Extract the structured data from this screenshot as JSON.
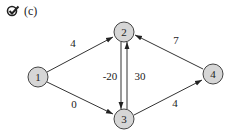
{
  "caption": {
    "icon": "check-badge-icon",
    "label": "(c)"
  },
  "graph": {
    "nodes": [
      {
        "id": "1",
        "label": "1",
        "x": 38,
        "y": 77
      },
      {
        "id": "2",
        "label": "2",
        "x": 124,
        "y": 32
      },
      {
        "id": "3",
        "label": "3",
        "x": 124,
        "y": 119
      },
      {
        "id": "4",
        "label": "4",
        "x": 213,
        "y": 74
      }
    ],
    "edges": [
      {
        "from": "1",
        "to": "2",
        "weight": "4"
      },
      {
        "from": "1",
        "to": "3",
        "weight": "0"
      },
      {
        "from": "2",
        "to": "3",
        "weight": "-20"
      },
      {
        "from": "3",
        "to": "2",
        "weight": "30"
      },
      {
        "from": "3",
        "to": "4",
        "weight": "4"
      },
      {
        "from": "4",
        "to": "2",
        "weight": "7"
      }
    ],
    "colors": {
      "node_fill": "#d6d6d6",
      "node_stroke": "#444444",
      "edge": "#333333"
    }
  }
}
